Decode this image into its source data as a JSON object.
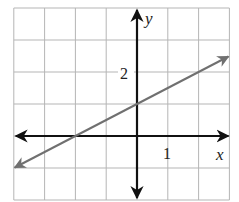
{
  "chart_data": {
    "type": "line",
    "title": "",
    "xlabel": "x",
    "ylabel": "y",
    "xlim": [
      -4,
      3
    ],
    "ylim": [
      -2,
      4
    ],
    "grid": true,
    "grid_step": 1,
    "tick_labels": {
      "x": [
        {
          "value": 1,
          "label": "1"
        }
      ],
      "y": [
        {
          "value": 2,
          "label": "2"
        }
      ]
    },
    "series": [
      {
        "name": "line",
        "equation": "y = 0.5x + 1",
        "points": [
          [
            -4,
            -1
          ],
          [
            -2,
            0
          ],
          [
            0,
            1
          ],
          [
            3,
            2.5
          ]
        ],
        "arrows_both_ends": true,
        "color": "#707070"
      }
    ],
    "axis_color": "#111111",
    "grid_color": "#b5b5b5"
  },
  "labels": {
    "x_axis": "x",
    "y_axis": "y",
    "x_tick": "1",
    "y_tick": "2"
  }
}
